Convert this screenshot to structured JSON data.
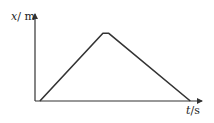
{
  "chart_data": {
    "type": "line",
    "title": "",
    "xlabel": "t/s",
    "ylabel": "x/m",
    "x": [
      0.5,
      7,
      7.6,
      16
    ],
    "values": [
      0,
      7,
      7,
      0
    ],
    "series": [
      {
        "name": "x-t",
        "x": [
          0.5,
          7,
          7.6,
          16
        ],
        "values": [
          0,
          7,
          7,
          0
        ]
      }
    ],
    "xlim": [
      0,
      17
    ],
    "ylim": [
      0,
      9
    ],
    "grid": false,
    "legend": "none",
    "tick_labels": false,
    "annotations": []
  },
  "axes": {
    "y_label_var": "x",
    "y_label_unit": "/ m",
    "x_label_var": "t",
    "x_label_unit": "/s"
  },
  "colors": {
    "axis": "#333333",
    "line": "#333333",
    "background": "#ffffff"
  }
}
